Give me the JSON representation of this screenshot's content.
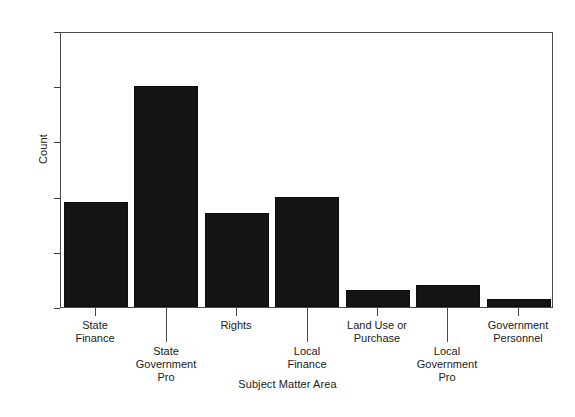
{
  "chart_data": {
    "type": "bar",
    "title": "",
    "xlabel": "Subject Matter Area",
    "ylabel": "Count",
    "categories": [
      "State\nFinance",
      "State\nGovernment\nPro",
      "Rights",
      "Local\nFinance",
      "Land Use or\nPurchase",
      "Local\nGovernment\nPro",
      "Government\nPersonnel"
    ],
    "values": [
      19,
      40,
      17,
      20,
      3,
      4,
      1.5
    ],
    "ylim": [
      0,
      50
    ],
    "yticks": [
      0,
      10,
      20,
      30,
      40,
      50
    ],
    "ytick_labels": [
      "0",
      "10",
      "20",
      "30",
      "40",
      "50"
    ],
    "grid": false,
    "legend": false,
    "bar_color": "#141414",
    "frame_color": "#4a4a4a",
    "label_stagger": [
      "upper",
      "lower",
      "upper",
      "lower",
      "upper",
      "lower",
      "upper"
    ]
  },
  "axes": {
    "y_title": "Count",
    "x_title": "Subject Matter Area"
  }
}
